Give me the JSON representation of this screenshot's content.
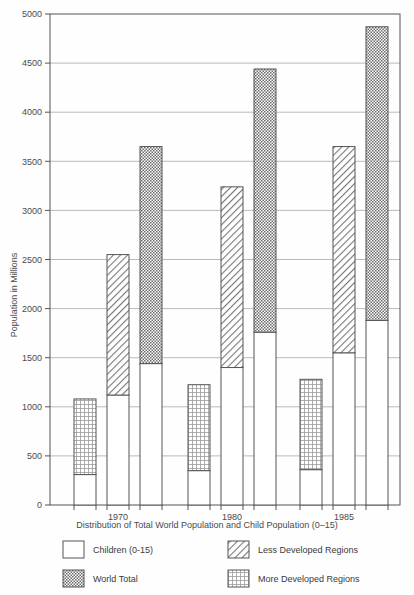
{
  "chart_data": {
    "type": "bar",
    "title": "",
    "caption": "Distribution of Total World Population and Child Population (0–15)",
    "xlabel": "",
    "ylabel": "Population in Millions",
    "ylim": [
      0,
      5000
    ],
    "ytick_step": 500,
    "yticks": [
      "0",
      "500",
      "1000",
      "1500",
      "2000",
      "2500",
      "3000",
      "3500",
      "4000",
      "4500",
      "5000"
    ],
    "categories": [
      "1970",
      "1980",
      "1985"
    ],
    "grid": true,
    "legend_position": "below-axes",
    "stacked": true,
    "series": [
      {
        "name": "More Developed Regions",
        "pattern": "fine-dot-grid",
        "children_values": [
          310,
          350,
          360
        ],
        "values": [
          1080,
          1225,
          1280
        ]
      },
      {
        "name": "Less Developed Regions",
        "pattern": "diagonal-hatch",
        "children_values": [
          1120,
          1400,
          1550
        ],
        "values": [
          2550,
          3240,
          3650
        ]
      },
      {
        "name": "World Total",
        "pattern": "dense-checker",
        "children_values": [
          1440,
          1760,
          1880
        ],
        "values": [
          3650,
          4440,
          4870
        ]
      }
    ],
    "base_series_name": "Children (0–15)"
  },
  "legend": {
    "items": [
      {
        "label": "Children (0-15)",
        "swatch": "white-blank"
      },
      {
        "label": "Less Developed Regions",
        "swatch": "diagonal-hatch"
      },
      {
        "label": "World Total",
        "swatch": "dense-checker"
      },
      {
        "label": "More Developed Regions",
        "swatch": "fine-dot-grid"
      }
    ]
  },
  "colors": {
    "axis": "#555555",
    "grid": "#aaaaaa",
    "bar_outline": "#555555",
    "bar_fill": "#ffffff",
    "pattern_ink": "#6b6b6b",
    "background": "#fefefe",
    "text": "#3a3a3a"
  }
}
